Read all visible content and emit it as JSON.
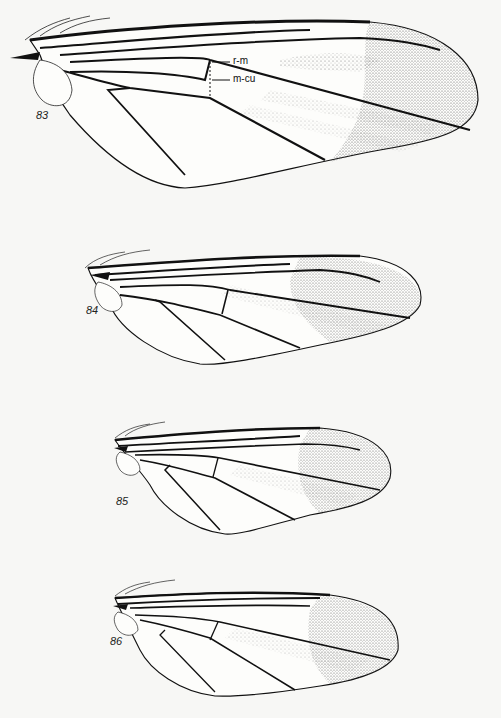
{
  "plate": {
    "figures": [
      {
        "id": "83",
        "label": "83",
        "annotations": [
          {
            "text": "r-m"
          },
          {
            "text": "m-cu"
          }
        ]
      },
      {
        "id": "84",
        "label": "84"
      },
      {
        "id": "85",
        "label": "85"
      },
      {
        "id": "86",
        "label": "86"
      }
    ]
  },
  "colors": {
    "ink": "#111111",
    "stipple": "#555555",
    "paper": "#f7f7f5"
  }
}
